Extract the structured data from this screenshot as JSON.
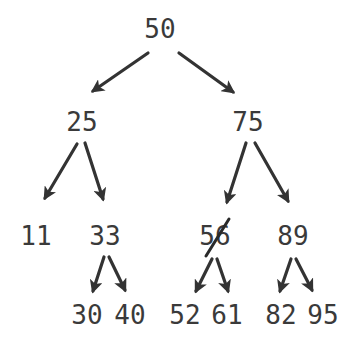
{
  "diagram": {
    "type": "binary-search-tree",
    "text_color": "#3a3a3a",
    "edge_color": "#333333",
    "nodes": [
      {
        "id": "n50",
        "label": "50",
        "x": 160,
        "y": 38,
        "deleted": false
      },
      {
        "id": "n25",
        "label": "25",
        "x": 82,
        "y": 131,
        "deleted": false
      },
      {
        "id": "n75",
        "label": "75",
        "x": 248,
        "y": 131,
        "deleted": false
      },
      {
        "id": "n11",
        "label": "11",
        "x": 36,
        "y": 245,
        "deleted": false
      },
      {
        "id": "n33",
        "label": "33",
        "x": 105,
        "y": 245,
        "deleted": false
      },
      {
        "id": "n56",
        "label": "56",
        "x": 215,
        "y": 245,
        "deleted": true
      },
      {
        "id": "n89",
        "label": "89",
        "x": 293,
        "y": 245,
        "deleted": false
      },
      {
        "id": "n30",
        "label": "30",
        "x": 87,
        "y": 324,
        "deleted": false
      },
      {
        "id": "n40",
        "label": "40",
        "x": 130,
        "y": 324,
        "deleted": false
      },
      {
        "id": "n52",
        "label": "52",
        "x": 185,
        "y": 324,
        "deleted": false
      },
      {
        "id": "n61",
        "label": "61",
        "x": 227,
        "y": 324,
        "deleted": false
      },
      {
        "id": "n82",
        "label": "82",
        "x": 281,
        "y": 324,
        "deleted": false
      },
      {
        "id": "n95",
        "label": "95",
        "x": 323,
        "y": 324,
        "deleted": false
      }
    ],
    "edges": [
      {
        "from": "50",
        "to": "25"
      },
      {
        "from": "50",
        "to": "75"
      },
      {
        "from": "25",
        "to": "11"
      },
      {
        "from": "25",
        "to": "33"
      },
      {
        "from": "75",
        "to": "56"
      },
      {
        "from": "75",
        "to": "89"
      },
      {
        "from": "33",
        "to": "30"
      },
      {
        "from": "33",
        "to": "40"
      },
      {
        "from": "56",
        "to": "52"
      },
      {
        "from": "56",
        "to": "61"
      },
      {
        "from": "89",
        "to": "82"
      },
      {
        "from": "89",
        "to": "95"
      }
    ],
    "annotations": [
      {
        "type": "strikethrough",
        "target": "56"
      }
    ]
  }
}
